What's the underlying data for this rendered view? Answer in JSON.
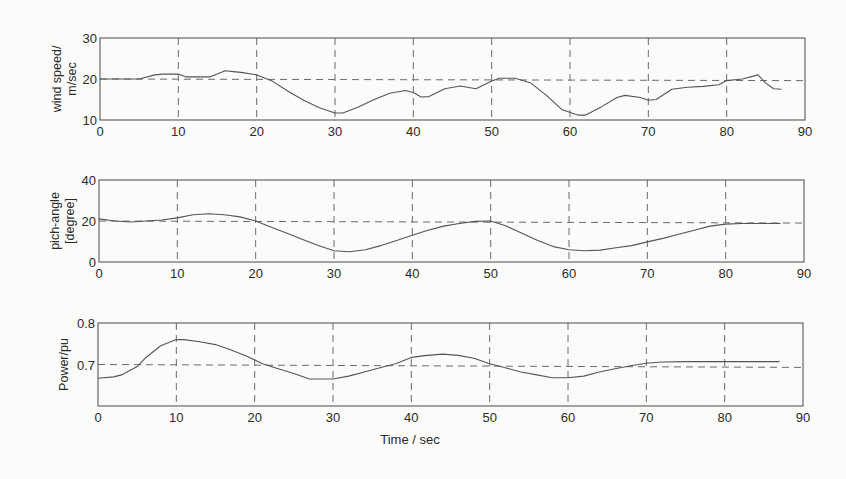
{
  "figure": {
    "xlabel": "Time / sec",
    "line_color": "#555555",
    "axis_color": "#5a5a5a",
    "grid_color": "#6a6a6a"
  },
  "chart_data": [
    {
      "type": "line",
      "title": "",
      "ylabel": [
        "wind speed/",
        "m/sec"
      ],
      "xlabel": "",
      "xlim": [
        0,
        90
      ],
      "ylim": [
        10,
        30
      ],
      "xticks": [
        0,
        10,
        20,
        30,
        40,
        50,
        60,
        70,
        80,
        90
      ],
      "yticks": [
        10,
        20,
        30
      ],
      "grid": "dashed",
      "reference_line": 20,
      "reference_line_slope_end": 19.6,
      "series": [
        {
          "name": "wind speed",
          "x": [
            0,
            5,
            7,
            8,
            10,
            11,
            12,
            14,
            16,
            17,
            18,
            20,
            22,
            24,
            26,
            28,
            30,
            31,
            33,
            35,
            37,
            39,
            40,
            41,
            42,
            44,
            46,
            48,
            50,
            51,
            53,
            55,
            57,
            59,
            61,
            62,
            64,
            66,
            67,
            69,
            70,
            71,
            73,
            75,
            77,
            79,
            80,
            82,
            84,
            85,
            86,
            87
          ],
          "y": [
            20,
            20,
            21,
            21.2,
            21.2,
            20.5,
            20.5,
            20.5,
            22,
            21.8,
            21.6,
            21,
            19.5,
            17,
            14.8,
            13,
            11.7,
            11.7,
            13.2,
            15,
            16.5,
            17.2,
            16.7,
            15.6,
            15.7,
            17.6,
            18.3,
            17.6,
            19.5,
            20.2,
            20.2,
            19,
            16,
            12.5,
            11.2,
            11.2,
            13.2,
            15.5,
            16,
            15.5,
            14.8,
            15,
            17.5,
            18,
            18.2,
            18.6,
            19.6,
            20,
            21,
            19,
            17.6,
            17.5
          ]
        }
      ]
    },
    {
      "type": "line",
      "title": "",
      "ylabel": [
        "pich-angle",
        "[degree]"
      ],
      "xlabel": "",
      "xlim": [
        0,
        90
      ],
      "ylim": [
        0,
        40
      ],
      "xticks": [
        0,
        10,
        20,
        30,
        40,
        50,
        60,
        70,
        80,
        90
      ],
      "yticks": [
        0,
        20,
        40
      ],
      "grid": "dashed",
      "reference_line": 20,
      "reference_line_slope_end": 19,
      "series": [
        {
          "name": "pitch angle",
          "x": [
            0,
            2,
            4,
            6,
            8,
            10,
            12,
            14,
            16,
            18,
            20,
            22,
            24,
            26,
            28,
            30,
            32,
            34,
            36,
            38,
            40,
            42,
            44,
            46,
            48,
            50,
            52,
            54,
            56,
            58,
            60,
            62,
            64,
            66,
            68,
            70,
            72,
            74,
            76,
            78,
            80,
            82,
            84,
            86,
            87
          ],
          "y": [
            21,
            20,
            19.5,
            20,
            20.5,
            21.5,
            23,
            23.5,
            23,
            22,
            20,
            17,
            14,
            11,
            8,
            5.5,
            5,
            6,
            8,
            10.5,
            13,
            15.5,
            17.5,
            18.8,
            19.8,
            20,
            17.5,
            14,
            10.5,
            7.5,
            6,
            5.5,
            5.8,
            7,
            8,
            9.8,
            11.5,
            13.5,
            15.5,
            17.5,
            18.5,
            18.8,
            18.8,
            18.8,
            18.8
          ]
        }
      ]
    },
    {
      "type": "line",
      "title": "",
      "ylabel": [
        "Power/pu"
      ],
      "xlabel": "Time / sec",
      "xlim": [
        0,
        90
      ],
      "ylim": [
        0.6,
        0.8
      ],
      "xticks": [
        0,
        10,
        20,
        30,
        40,
        50,
        60,
        70,
        80,
        90
      ],
      "yticks": [
        0.7,
        0.8
      ],
      "grid": "dashed",
      "reference_line": 0.7,
      "reference_line_slope_end": 0.693,
      "series": [
        {
          "name": "power",
          "x": [
            0,
            2,
            3,
            5,
            6,
            8,
            10,
            11,
            13,
            15,
            17,
            19,
            21,
            23,
            25,
            27,
            29,
            30,
            32,
            34,
            36,
            38,
            40,
            42,
            44,
            46,
            48,
            50,
            52,
            54,
            56,
            58,
            60,
            62,
            64,
            66,
            68,
            70,
            72,
            75,
            80,
            85,
            87
          ],
          "y": [
            0.667,
            0.67,
            0.675,
            0.695,
            0.715,
            0.745,
            0.76,
            0.76,
            0.755,
            0.748,
            0.735,
            0.72,
            0.702,
            0.69,
            0.678,
            0.665,
            0.665,
            0.665,
            0.672,
            0.682,
            0.692,
            0.702,
            0.717,
            0.722,
            0.725,
            0.722,
            0.715,
            0.702,
            0.692,
            0.682,
            0.675,
            0.668,
            0.668,
            0.672,
            0.682,
            0.69,
            0.697,
            0.703,
            0.706,
            0.707,
            0.707,
            0.707,
            0.707
          ]
        }
      ]
    }
  ]
}
